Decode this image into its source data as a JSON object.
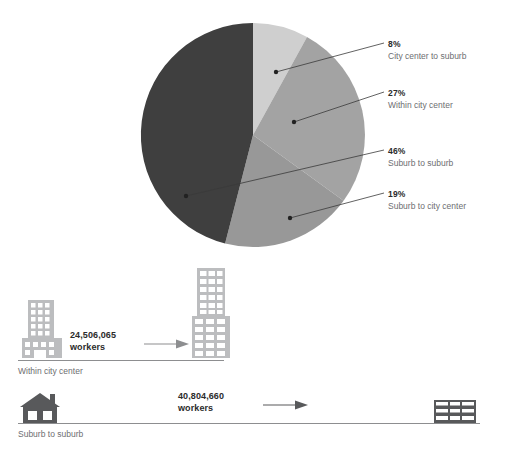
{
  "chart_data": {
    "type": "pie",
    "title": "",
    "categories": [
      "City center to suburb",
      "Within city center",
      "Suburb to suburb",
      "Suburb to city center"
    ],
    "values": [
      8,
      27,
      46,
      19
    ],
    "value_labels": [
      "8%",
      "27%",
      "46%",
      "19%"
    ],
    "colors": [
      "#cfcfcf",
      "#a3a3a3",
      "#3f3f3f",
      "#989898"
    ],
    "legend_position": "right",
    "grid": false,
    "start_angle_deg": 0,
    "direction": "clockwise",
    "slice_order_from_12oclock": [
      "City center to suburb",
      "Within city center",
      "Suburb to city center",
      "Suburb to suburb"
    ]
  },
  "pie": {
    "center_x": 253,
    "center_y": 135,
    "radius": 112,
    "slices": [
      {
        "label": "City center to suburb",
        "percent": "8%",
        "value": 8,
        "color": "#cfcfcf",
        "callout_x": 276,
        "callout_y": 72,
        "leader_to_x": 384,
        "leader_to_y": 43
      },
      {
        "label": "Within city center",
        "percent": "27%",
        "value": 27,
        "color": "#a3a3a3",
        "callout_x": 294,
        "callout_y": 122,
        "leader_to_x": 384,
        "leader_to_y": 92
      },
      {
        "label": "Suburb to suburb",
        "percent": "46%",
        "value": 46,
        "color": "#3f3f3f",
        "callout_x": 186,
        "callout_y": 196,
        "leader_to_x": 384,
        "leader_to_y": 150
      },
      {
        "label": "Suburb to city center",
        "percent": "19%",
        "value": 19,
        "color": "#989898",
        "callout_x": 290,
        "callout_y": 218,
        "leader_to_x": 384,
        "leader_to_y": 193
      }
    ]
  },
  "legend": [
    {
      "percent": "8%",
      "label": "City center to suburb"
    },
    {
      "percent": "27%",
      "label": "Within city center"
    },
    {
      "percent": "46%",
      "label": "Suburb to suburb"
    },
    {
      "percent": "19%",
      "label": "Suburb to city center"
    }
  ],
  "flows": [
    {
      "figure_number": "24,506,065",
      "figure_unit": "workers",
      "caption": "Within city center",
      "origin_icon": "office-building-icon",
      "destination_icon": "skyscraper-icon",
      "arrow_icon": "arrow-right-icon"
    },
    {
      "figure_number": "40,804,660",
      "figure_unit": "workers",
      "caption": "Suburb to suburb",
      "origin_icon": "house-icon",
      "destination_icon": "low-rise-building-icon",
      "arrow_icon": "arrow-right-icon"
    }
  ],
  "colors": {
    "light_gray": "#cfcfcf",
    "mid_gray": "#a3a3a3",
    "mid_gray_2": "#989898",
    "dark_gray": "#3f3f3f",
    "icon_gray": "#bcbdbf",
    "icon_dark": "#58595b",
    "text_dark": "#2b2b2b",
    "text_muted": "#6d6e71",
    "rule": "#8d8e90"
  }
}
